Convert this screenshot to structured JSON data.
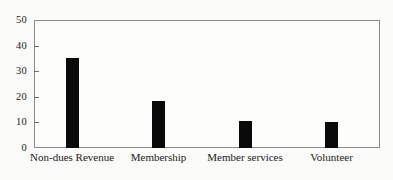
{
  "chart_data": {
    "type": "bar",
    "title": "",
    "subtitle": "",
    "xlabel": "",
    "ylabel": "",
    "categories": [
      "Non-dues Revenue",
      "Membership",
      "Member services",
      "Volunteer"
    ],
    "values": [
      35,
      18.5,
      10.5,
      10
    ],
    "series": [
      {
        "name": "",
        "values": [
          35,
          18.5,
          10.5,
          10
        ]
      }
    ],
    "ylim": [
      0,
      50
    ],
    "yticks": [
      0,
      10,
      20,
      30,
      40,
      50
    ],
    "ytick_labels": [
      "0",
      "10",
      "20",
      "30",
      "40",
      "50"
    ],
    "grid": false,
    "legend": false,
    "legend_position": "none",
    "bar_color": "#0a0a0a",
    "frame_color": "#8b8b8b",
    "background_color": "#fdfdfc"
  },
  "figure": {
    "name": "bar-chart",
    "plot_background": "#fdfdfc"
  }
}
